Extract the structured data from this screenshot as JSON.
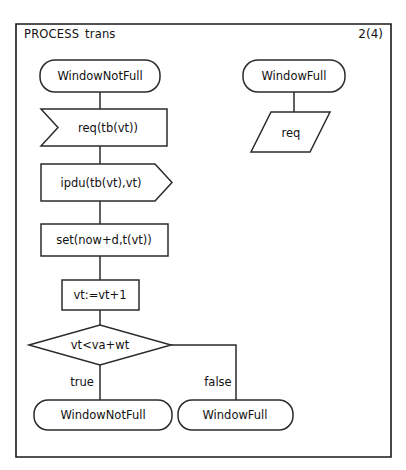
{
  "diagram": {
    "kind": "sdl-process-flowchart",
    "header": {
      "keyword": "PROCESS",
      "name": "trans",
      "page": "2(4)"
    },
    "nodes": {
      "start_state_left": {
        "label": "WindowNotFull",
        "shape": "state"
      },
      "input_req": {
        "label": "req(tb(vt))",
        "shape": "input"
      },
      "output_ipdu": {
        "label": "ipdu(tb(vt),vt)",
        "shape": "output"
      },
      "task_set": {
        "label": "set(now+d,t(vt))",
        "shape": "task"
      },
      "task_increment": {
        "label": "vt:=vt+1",
        "shape": "task"
      },
      "decision": {
        "label": "vt<va+wt",
        "shape": "decision"
      },
      "end_state_true": {
        "label": "WindowNotFull",
        "shape": "state"
      },
      "end_state_false": {
        "label": "WindowFull",
        "shape": "state"
      },
      "start_state_right": {
        "label": "WindowFull",
        "shape": "state"
      },
      "save_req": {
        "label": "req",
        "shape": "save"
      }
    },
    "branches": {
      "true_label": "true",
      "false_label": "false"
    },
    "colors": {
      "stroke": "#2b2b2b",
      "frame": "#1a1a1a",
      "fill": "#ffffff",
      "text": "#111111"
    }
  }
}
